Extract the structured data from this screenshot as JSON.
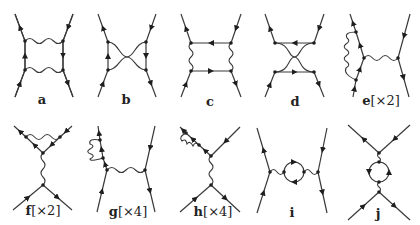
{
  "figure": {
    "diagrams": [
      {
        "id": "a",
        "letter": "a",
        "multiplicity": ""
      },
      {
        "id": "b",
        "letter": "b",
        "multiplicity": ""
      },
      {
        "id": "c",
        "letter": "c",
        "multiplicity": ""
      },
      {
        "id": "d",
        "letter": "d",
        "multiplicity": ""
      },
      {
        "id": "e",
        "letter": "e",
        "multiplicity": "[×2]"
      },
      {
        "id": "f",
        "letter": "f",
        "multiplicity": "[×2]"
      },
      {
        "id": "g",
        "letter": "g",
        "multiplicity": "[×4]"
      },
      {
        "id": "h",
        "letter": "h",
        "multiplicity": "[×4]"
      },
      {
        "id": "i",
        "letter": "i",
        "multiplicity": ""
      },
      {
        "id": "j",
        "letter": "j",
        "multiplicity": ""
      }
    ],
    "colors": {
      "line": "#3a3a3a",
      "vertex": "#1e1e1e",
      "background": "#ffffff"
    }
  }
}
